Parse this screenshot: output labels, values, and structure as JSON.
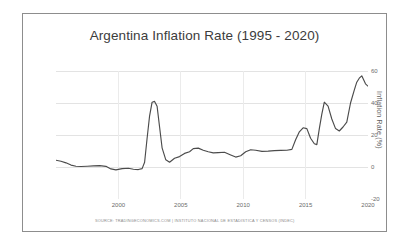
{
  "chart": {
    "title": "Argentina Inflation Rate (1995 - 2020)",
    "y_axis_title": "Inflation Rate (%)",
    "source_note": "SOURCE: TRADINGECONOMICS.COM | INSTITUTO NACIONAL DE ESTADISTICA Y CENSOS (INDEC)",
    "line_color": "#4b4b4b",
    "grid_color": "#e3e3e3",
    "frame_color": "#8d8d8d"
  },
  "chart_data": {
    "type": "line",
    "title": "Argentina Inflation Rate (1995 - 2020)",
    "xlabel": "",
    "ylabel": "Inflation Rate (%)",
    "xlim": [
      1995,
      2020
    ],
    "ylim": [
      -20,
      60
    ],
    "grid": true,
    "legend": "none",
    "xticks": [
      2000,
      2005,
      2010,
      2015,
      2020
    ],
    "yticks": [
      -20,
      0,
      20,
      40,
      60
    ],
    "series": [
      {
        "name": "Inflation Rate (%)",
        "x": [
          1995.0,
          1995.4,
          1995.8,
          1996.2,
          1996.6,
          1997.0,
          1997.5,
          1998.0,
          1998.5,
          1999.0,
          1999.4,
          1999.8,
          2000.3,
          2000.8,
          2001.2,
          2001.6,
          2001.9,
          2002.1,
          2002.3,
          2002.5,
          2002.7,
          2002.9,
          2003.1,
          2003.3,
          2003.5,
          2003.8,
          2004.1,
          2004.5,
          2004.9,
          2005.3,
          2005.7,
          2006.0,
          2006.4,
          2006.8,
          2007.2,
          2007.6,
          2008.0,
          2008.5,
          2009.0,
          2009.4,
          2009.8,
          2010.2,
          2010.6,
          2011.0,
          2011.5,
          2012.0,
          2012.5,
          2013.0,
          2013.5,
          2013.9,
          2014.2,
          2014.5,
          2014.8,
          2015.1,
          2015.4,
          2015.7,
          2015.9,
          2016.1,
          2016.3,
          2016.5,
          2016.8,
          2017.1,
          2017.4,
          2017.7,
          2018.0,
          2018.3,
          2018.6,
          2018.9,
          2019.1,
          2019.3,
          2019.5,
          2019.8,
          2020.0
        ],
        "y": [
          4.2,
          3.6,
          2.6,
          1.2,
          0.5,
          0.3,
          0.5,
          0.7,
          0.9,
          0.4,
          -1.2,
          -1.8,
          -1.0,
          -0.8,
          -1.4,
          -1.6,
          -1.0,
          3.0,
          18.0,
          32.0,
          40.5,
          41.0,
          38.0,
          25.0,
          12.0,
          4.5,
          3.0,
          5.5,
          6.5,
          8.5,
          9.5,
          11.5,
          11.8,
          10.5,
          9.5,
          8.8,
          9.0,
          9.2,
          7.5,
          6.2,
          7.0,
          9.5,
          10.8,
          10.5,
          9.8,
          9.9,
          10.2,
          10.4,
          10.5,
          11.0,
          17.0,
          22.0,
          24.5,
          24.0,
          18.0,
          14.5,
          14.0,
          24.0,
          33.0,
          40.5,
          38.0,
          30.0,
          24.0,
          22.5,
          25.0,
          28.0,
          40.0,
          48.0,
          53.0,
          55.5,
          57.0,
          52.0,
          50.5
        ]
      }
    ]
  },
  "axis": {
    "yticks": [
      {
        "label": "60",
        "value": 60
      },
      {
        "label": "40",
        "value": 40
      },
      {
        "label": "20",
        "value": 20
      },
      {
        "label": "0",
        "value": 0
      },
      {
        "label": "-20",
        "value": -20
      }
    ],
    "xticks": [
      {
        "label": "2000",
        "value": 2000
      },
      {
        "label": "2005",
        "value": 2005
      },
      {
        "label": "2010",
        "value": 2010
      },
      {
        "label": "2015",
        "value": 2015
      },
      {
        "label": "2020",
        "value": 2020
      }
    ]
  }
}
